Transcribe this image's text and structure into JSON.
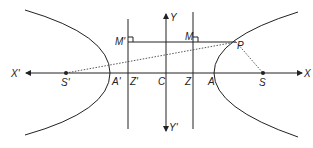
{
  "diagram": {
    "type": "hyperbola-focus-directrix",
    "colors": {
      "stroke": "#222222",
      "background": "#ffffff"
    },
    "labels": {
      "x_pos": "X",
      "x_neg": "X'",
      "y_pos": "Y",
      "y_neg": "Y'",
      "center": "C",
      "vertex_right": "A",
      "vertex_left": "A'",
      "focus_right": "S",
      "focus_left": "S'",
      "directrix_foot_right": "Z",
      "directrix_foot_left": "Z'",
      "foot_right": "M",
      "foot_left": "M'",
      "point": "P"
    }
  }
}
